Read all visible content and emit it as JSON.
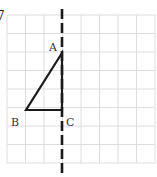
{
  "figure": {
    "type": "geometry-grid",
    "corner_glyph": "7",
    "grid": {
      "left": 7,
      "top": 15,
      "cell": 18.5,
      "cols": 8,
      "rows": 8,
      "line_color": "#dedede"
    },
    "mirror_line": {
      "label": "dashed vertical line",
      "x": 62,
      "y1": 9,
      "y2": 177,
      "color": "#1a1a1a"
    },
    "triangle": {
      "stroke": "#1a1a1a",
      "vertices": [
        {
          "name": "A",
          "x": 62,
          "y": 53,
          "label_x": 49,
          "label_y": 51
        },
        {
          "name": "B",
          "x": 26,
          "y": 110,
          "label_x": 11,
          "label_y": 126
        },
        {
          "name": "C",
          "x": 62,
          "y": 110,
          "label_x": 66,
          "label_y": 126
        }
      ]
    }
  }
}
